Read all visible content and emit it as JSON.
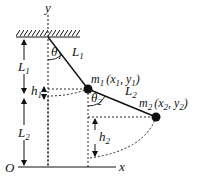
{
  "diagram": {
    "labels": {
      "y_axis": "y",
      "x_axis": "x",
      "origin": "O",
      "theta1": "θ",
      "theta1_sub": "1",
      "theta2": "θ",
      "theta2_sub": "2",
      "L1_rod": "L",
      "L1_rod_sub": "1",
      "L2_rod": "L",
      "L2_rod_sub": "2",
      "L1_dim": "L",
      "L1_dim_sub": "1",
      "L2_dim": "L",
      "L2_dim_sub": "2",
      "h1": "h",
      "h1_sub": "1",
      "h2": "h",
      "h2_sub": "2",
      "m1": "m",
      "m1_sub": "1",
      "m1_coords": "(x",
      "m1_coords_x_sub": "1",
      "m1_coords_mid": ", y",
      "m1_coords_y_sub": "1",
      "m1_coords_end": ")",
      "m2": "m",
      "m2_sub": "2",
      "m2_coords": "(x",
      "m2_coords_x_sub": "2",
      "m2_coords_mid": ", y",
      "m2_coords_y_sub": "2",
      "m2_coords_end": ")"
    },
    "colors": {
      "ink": "#111111",
      "background": "#ffffff"
    }
  }
}
